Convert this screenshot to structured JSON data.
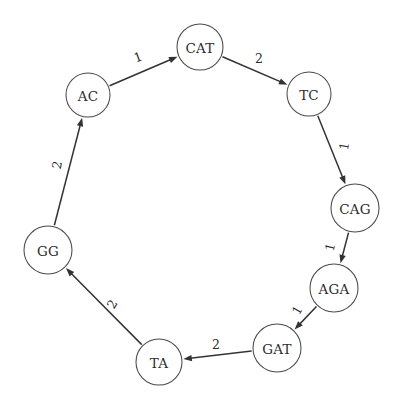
{
  "figure": {
    "type": "directed-cycle-graph",
    "background_color": "#ffffff",
    "node_stroke_color": "#4a4a4a",
    "node_fill_color": "#ffffff",
    "edge_color": "#333333",
    "text_color": "#2b2b2b"
  },
  "graph": {
    "node_radius": 23,
    "nodes": [
      {
        "id": "CAT",
        "label": "CAT",
        "cx": 200,
        "cy": 47,
        "r": 23
      },
      {
        "id": "TC",
        "label": "TC",
        "cx": 309,
        "cy": 94,
        "r": 22
      },
      {
        "id": "CAG",
        "label": "CAG",
        "cx": 355,
        "cy": 208,
        "r": 24
      },
      {
        "id": "AGA",
        "label": "AGA",
        "cx": 334,
        "cy": 288,
        "r": 24
      },
      {
        "id": "GAT",
        "label": "GAT",
        "cx": 277,
        "cy": 348,
        "r": 24
      },
      {
        "id": "TA",
        "label": "TA",
        "cx": 159,
        "cy": 362,
        "r": 23
      },
      {
        "id": "GG",
        "label": "GG",
        "cx": 48,
        "cy": 250,
        "r": 24
      },
      {
        "id": "AC",
        "label": "AC",
        "cx": 88,
        "cy": 95,
        "r": 22
      }
    ],
    "edges": [
      {
        "from": "AC",
        "to": "CAT",
        "weight": "1",
        "label_x": 138,
        "label_y": 57,
        "label_rotate": -20
      },
      {
        "from": "CAT",
        "to": "TC",
        "weight": "2",
        "label_x": 259,
        "label_y": 58,
        "label_rotate": 0
      },
      {
        "from": "TC",
        "to": "CAG",
        "weight": "1",
        "label_x": 344,
        "label_y": 146,
        "label_rotate": -80
      },
      {
        "from": "CAG",
        "to": "AGA",
        "weight": "1",
        "label_x": 330,
        "label_y": 247,
        "label_rotate": -75
      },
      {
        "from": "AGA",
        "to": "GAT",
        "weight": "1",
        "label_x": 297,
        "label_y": 310,
        "label_rotate": -60
      },
      {
        "from": "GAT",
        "to": "TA",
        "weight": "2",
        "label_x": 216,
        "label_y": 344,
        "label_rotate": 0
      },
      {
        "from": "TA",
        "to": "GG",
        "weight": "2",
        "label_x": 112,
        "label_y": 304,
        "label_rotate": -60
      },
      {
        "from": "GG",
        "to": "AC",
        "weight": "2",
        "label_x": 57,
        "label_y": 165,
        "label_rotate": -78
      }
    ]
  }
}
